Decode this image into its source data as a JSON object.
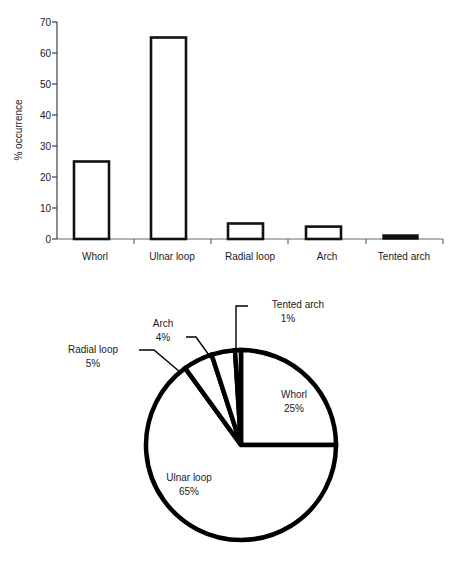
{
  "figure": {
    "background": "#ffffff",
    "ink_color": "#000000",
    "text_color": "#1a1a1a"
  },
  "chart_data": [
    {
      "type": "bar",
      "title": "",
      "subtitle": "",
      "xlabel": "",
      "ylabel": "% occurrence",
      "categories": [
        "Whorl",
        "Ulnar loop",
        "Radial loop",
        "Arch",
        "Tented arch"
      ],
      "values": [
        25,
        65,
        5,
        4,
        1
      ],
      "ylim": [
        0,
        70
      ],
      "yticks": [
        0,
        10,
        20,
        30,
        40,
        50,
        60,
        70
      ],
      "ytick_labels": [
        "0",
        "10",
        "20",
        "30",
        "40",
        "50",
        "60",
        "70"
      ],
      "grid": false,
      "legend": "none",
      "bar_style": "open-outline-black",
      "notes": "Tented arch bar (1%) renders as a thin solid black bar"
    },
    {
      "type": "pie",
      "title": "",
      "labels": [
        "Whorl",
        "Ulnar loop",
        "Radial loop",
        "Arch",
        "Tented arch"
      ],
      "values": [
        25,
        65,
        5,
        4,
        1
      ],
      "value_labels": [
        "25%",
        "65%",
        "5%",
        "4%",
        "1%"
      ],
      "start_angle_deg": 90,
      "direction": "clockwise",
      "legend": "none",
      "label_placement": [
        "inside",
        "inside",
        "leader-line",
        "leader-line",
        "leader-line"
      ],
      "slice_style": "outline-black-on-white"
    }
  ],
  "bar_chart": {
    "y_axis": {
      "title": "% occurrence",
      "ticks": [
        "70",
        "60",
        "50",
        "40",
        "30",
        "20",
        "10",
        "0"
      ]
    },
    "x_axis": {
      "categories": [
        {
          "label": "Whorl",
          "value": 25
        },
        {
          "label": "Ulnar loop",
          "value": 65
        },
        {
          "label": "Radial loop",
          "value": 5
        },
        {
          "label": "Arch",
          "value": 4
        },
        {
          "label": "Tented arch",
          "value": 1
        }
      ]
    }
  },
  "pie_chart": {
    "slices": [
      {
        "label": "Whorl",
        "percent": "25%",
        "value": 25
      },
      {
        "label": "Ulnar loop",
        "percent": "65%",
        "value": 65
      },
      {
        "label": "Radial loop",
        "percent": "5%",
        "value": 5
      },
      {
        "label": "Arch",
        "percent": "4%",
        "value": 4
      },
      {
        "label": "Tented arch",
        "percent": "1%",
        "value": 1
      }
    ]
  }
}
